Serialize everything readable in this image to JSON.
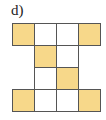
{
  "label": "d)",
  "colors": {
    "filled": "#f7d88a",
    "empty": "#ffffff",
    "border": "#555555"
  },
  "grid": {
    "origin": [
      12,
      23
    ],
    "cell_size": 22,
    "cells": [
      {
        "row": 0,
        "col": 0,
        "filled": true
      },
      {
        "row": 0,
        "col": 1,
        "filled": false
      },
      {
        "row": 0,
        "col": 2,
        "filled": false
      },
      {
        "row": 0,
        "col": 3,
        "filled": true
      },
      {
        "row": 1,
        "col": 1,
        "filled": true
      },
      {
        "row": 1,
        "col": 2,
        "filled": false
      },
      {
        "row": 2,
        "col": 1,
        "filled": false
      },
      {
        "row": 2,
        "col": 2,
        "filled": true
      },
      {
        "row": 3,
        "col": 0,
        "filled": true
      },
      {
        "row": 3,
        "col": 1,
        "filled": false
      },
      {
        "row": 3,
        "col": 2,
        "filled": false
      },
      {
        "row": 3,
        "col": 3,
        "filled": true
      }
    ]
  }
}
